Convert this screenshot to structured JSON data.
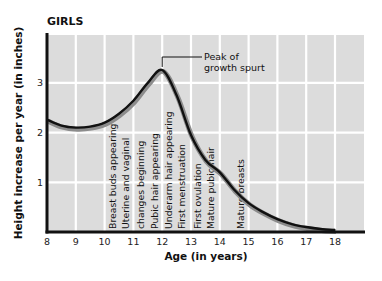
{
  "chart_data": {
    "type": "line",
    "title": "GIRLS",
    "xlabel": "Age (in years)",
    "ylabel": "Height increase per year (in inches)",
    "xlim": [
      8,
      19
    ],
    "ylim": [
      0,
      3.95
    ],
    "x_ticks": [
      8,
      9,
      10,
      11,
      12,
      13,
      14,
      15,
      16,
      17,
      18
    ],
    "y_ticks": [
      1,
      2,
      3
    ],
    "grid": true,
    "series": [
      {
        "name": "Girls growth rate",
        "x": [
          8,
          8.5,
          9,
          9.5,
          10,
          10.5,
          11,
          11.5,
          12,
          12.5,
          13,
          13.5,
          14,
          14.5,
          15,
          15.5,
          16,
          16.5,
          17,
          17.5,
          18
        ],
        "y": [
          2.26,
          2.14,
          2.1,
          2.12,
          2.2,
          2.38,
          2.64,
          3.0,
          3.26,
          2.75,
          1.95,
          1.45,
          1.2,
          0.85,
          0.58,
          0.4,
          0.26,
          0.16,
          0.1,
          0.06,
          0.04
        ]
      }
    ],
    "annotations": [
      {
        "text_lines": [
          "Peak of",
          "growth spurt"
        ],
        "x": 12,
        "y": 3.26
      }
    ],
    "events": [
      {
        "label": "Breast buds appearing",
        "age": 10.3
      },
      {
        "label": "Uterine and vaginal",
        "age": 10.75
      },
      {
        "label": "changes beginning",
        "age": 11.25
      },
      {
        "label": "Pubic hair appearing",
        "age": 11.75
      },
      {
        "label": "Underarm hair appearing",
        "age": 12.25
      },
      {
        "label": "First menstruation",
        "age": 12.7
      },
      {
        "label": "First ovulation",
        "age": 13.25
      },
      {
        "label": "Mature pubic hair",
        "age": 13.7
      },
      {
        "label": "Mature breasts",
        "age": 14.75
      }
    ],
    "colors": {
      "plot_background": "#dcdcdc",
      "grid": "#ffffff",
      "curve": "#111111",
      "curve_shadow": "#8c8c8c",
      "axis": "#111111"
    }
  }
}
